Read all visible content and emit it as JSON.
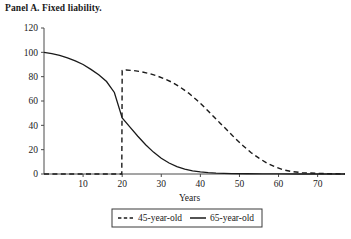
{
  "panel": {
    "title": "Panel A. Fixed liability."
  },
  "chart_data": {
    "type": "line",
    "title": "Panel A. Fixed liability.",
    "xlabel": "Years",
    "ylabel": "",
    "xlim": [
      0,
      77
    ],
    "ylim": [
      0,
      120
    ],
    "grid": false,
    "legend_position": "bottom-center",
    "xticks": [
      10,
      20,
      30,
      40,
      50,
      60,
      70
    ],
    "xtick_labels": [
      "10",
      "20",
      "30",
      "40",
      "50",
      "60",
      "70"
    ],
    "yticks": [
      0,
      20,
      40,
      60,
      80,
      100,
      120
    ],
    "ytick_labels": [
      "0",
      "20",
      "40",
      "60",
      "80",
      "100",
      "120"
    ],
    "series": [
      {
        "name": "45-year-old",
        "style": "dashed",
        "x": [
          0,
          5,
          10,
          15,
          19.9,
          20,
          21,
          23,
          25,
          27,
          29,
          31,
          33,
          35,
          37,
          39,
          41,
          43,
          45,
          47,
          49,
          51,
          53,
          55,
          57,
          59,
          61,
          63,
          66,
          70,
          74,
          77
        ],
        "values": [
          0,
          0,
          0,
          0,
          0,
          85,
          85.5,
          85,
          84,
          82.5,
          80.5,
          78,
          75,
          71,
          66.5,
          61,
          55,
          48.5,
          42,
          35.5,
          29,
          23,
          17.5,
          13,
          9,
          6,
          3.6,
          2.2,
          1.1,
          0.5,
          0.2,
          0.1
        ]
      },
      {
        "name": "65-year-old",
        "style": "solid",
        "x": [
          0,
          2,
          4,
          6,
          8,
          10,
          12,
          14,
          16,
          18,
          20,
          22,
          24,
          26,
          28,
          30,
          32,
          34,
          36,
          38,
          40,
          42,
          44,
          46,
          48,
          52,
          56,
          60,
          65,
          70,
          77
        ],
        "values": [
          100,
          99,
          97.5,
          95.5,
          93,
          90,
          86,
          81.5,
          76,
          67,
          46,
          38.5,
          31,
          24,
          18,
          13,
          9,
          6,
          4,
          2.6,
          1.7,
          1.1,
          0.7,
          0.5,
          0.35,
          0.2,
          0.1,
          0.05,
          0,
          0,
          0
        ]
      }
    ],
    "legend": [
      {
        "label": "45-year-old",
        "style": "dashed"
      },
      {
        "label": "65-year-old",
        "style": "solid"
      }
    ],
    "colors": {
      "series_line": "#1a1a1a",
      "axis": "#4a4a4a",
      "text": "#1a1a1a",
      "background": "#ffffff"
    }
  }
}
